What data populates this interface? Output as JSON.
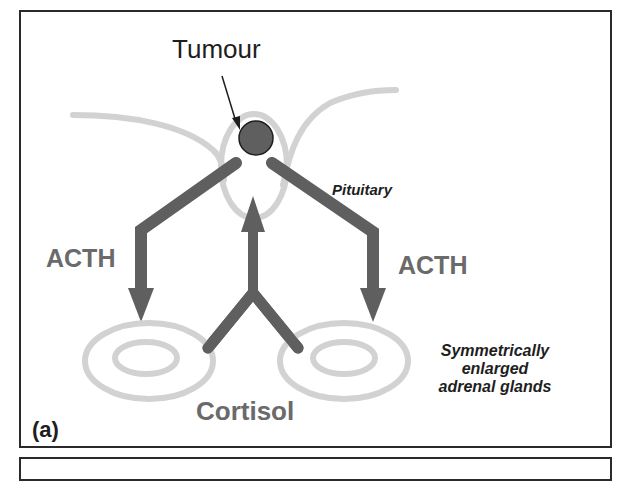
{
  "figure": {
    "panel_label": "(a)",
    "labels": {
      "tumour": "Tumour",
      "pituitary": "Pituitary",
      "acth_left": "ACTH",
      "acth_right": "ACTH",
      "cortisol": "Cortisol",
      "adrenal_caption": [
        "Symmetrically",
        "enlarged",
        "adrenal glands"
      ]
    },
    "colors": {
      "frame": "#2a2a2a",
      "arrow": "#5f5f5f",
      "tumour_fill": "#5f5f5f",
      "outline_gray": "#d0d0d0",
      "label_dark": "#1e1e1e",
      "label_gray": "#6a6a6a"
    }
  }
}
